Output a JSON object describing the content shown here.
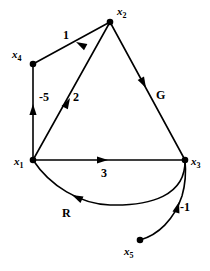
{
  "figure": {
    "kind": "directed-graph-diagram",
    "background_color": "#ffffff",
    "stroke_color": "#000000",
    "width": 210,
    "height": 271
  },
  "nodes": [
    {
      "id": "x1",
      "base": "x",
      "sub": "1",
      "label": "x1",
      "cx": 33,
      "cy": 160,
      "label_x": 14,
      "label_y": 165,
      "sub_dx": 8,
      "sub_dy": 3
    },
    {
      "id": "x2",
      "base": "x",
      "sub": "2",
      "label": "x2",
      "cx": 110,
      "cy": 22,
      "label_x": 117,
      "label_y": 15,
      "sub_dx": 8,
      "sub_dy": 3
    },
    {
      "id": "x3",
      "base": "x",
      "sub": "3",
      "label": "x3",
      "cx": 185,
      "cy": 160,
      "label_x": 191,
      "label_y": 165,
      "sub_dx": 8,
      "sub_dy": 3
    },
    {
      "id": "x4",
      "base": "x",
      "sub": "4",
      "label": "x4",
      "cx": 33,
      "cy": 64,
      "label_x": 12,
      "label_y": 58,
      "sub_dx": 8,
      "sub_dy": 3
    },
    {
      "id": "x5",
      "base": "x",
      "sub": "5",
      "label": "x5",
      "cx": 140,
      "cy": 240,
      "label_x": 124,
      "label_y": 255,
      "sub_dx": 8,
      "sub_dy": 3
    }
  ],
  "edges": [
    {
      "id": "e-x2-x4",
      "from": "x2",
      "to": "x4",
      "label": "1",
      "label_x": 63,
      "label_y": 39,
      "shape": "straight",
      "arrow_at": {
        "x": 76,
        "y": 42,
        "angle": 208
      }
    },
    {
      "id": "e-x1-x4",
      "from": "x1",
      "to": "x4",
      "label": "-5",
      "label_x": 39,
      "label_y": 101,
      "shape": "straight",
      "arrow_at": {
        "x": 33,
        "y": 104,
        "angle": 270
      }
    },
    {
      "id": "e-x1-x2",
      "from": "x1",
      "to": "x2",
      "label": "2",
      "label_x": 73,
      "label_y": 101,
      "shape": "straight",
      "arrow_at": {
        "x": 70,
        "y": 98,
        "angle": 299
      }
    },
    {
      "id": "e-x2-x3",
      "from": "x2",
      "to": "x3",
      "label": "G",
      "label_x": 156,
      "label_y": 99,
      "shape": "straight",
      "arrow_at": {
        "x": 146,
        "y": 88,
        "angle": 62
      }
    },
    {
      "id": "e-x1-x3",
      "from": "x1",
      "to": "x3",
      "label": "3",
      "label_x": 101,
      "label_y": 177,
      "shape": "straight",
      "arrow_at": {
        "x": 108,
        "y": 160,
        "angle": 0
      }
    },
    {
      "id": "e-x3-x1",
      "from": "x3",
      "to": "x1",
      "label": "R",
      "label_x": 62,
      "label_y": 217,
      "shape": "curve",
      "arrow_at": {
        "x": 72,
        "y": 195,
        "angle": 205
      }
    },
    {
      "id": "e-x5-x3",
      "from": "x5",
      "to": "x3",
      "label": "-1",
      "label_x": 180,
      "label_y": 211,
      "shape": "curve",
      "arrow_at": {
        "x": 179,
        "y": 202,
        "angle": 286
      }
    }
  ]
}
